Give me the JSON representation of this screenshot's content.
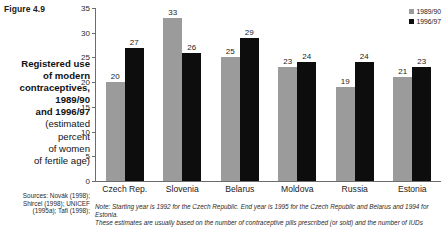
{
  "figure": {
    "number": "Figure 4.9",
    "caption_lines": [
      "Registered use",
      "of modern",
      "contraceptives,",
      "1989/90",
      "and 1996/97"
    ],
    "caption_light_lines": [
      "(estimated",
      "percent",
      "of women",
      "of fertile age)"
    ],
    "sources_lines": [
      "Sources: Novák (1998);",
      "Shircel (1998); UNICEF",
      "(1995a); Tafi (1998);"
    ],
    "note_lines": [
      "Note: Starting year is 1992 for the Czech Republic. End year is 1995 for the Czech Republic and Belarus and 1994 for Estonia.",
      "These estimates are usually based on the number of contraceptive pills prescribed (or sold) and the number of IUDs supplied"
    ]
  },
  "legend": {
    "position": "top-right",
    "entries": [
      {
        "label": "1989/90",
        "color": "#9b9b9b"
      },
      {
        "label": "1996/97",
        "color": "#0d0d0d"
      }
    ]
  },
  "chart_data": {
    "type": "bar",
    "title": "Registered use of modern contraceptives, 1989/90 and 1996/97 (estimated percent of women of fertile age)",
    "xlabel": "",
    "ylabel": "",
    "ylim": [
      0,
      35
    ],
    "yticks": [
      0,
      5,
      10,
      15,
      20,
      25,
      30,
      35
    ],
    "grid": false,
    "categories": [
      "Czech Rep.",
      "Slovenia",
      "Belarus",
      "Moldova",
      "Russia",
      "Estonia"
    ],
    "series": [
      {
        "name": "1989/90",
        "color": "#9b9b9b",
        "values": [
          20,
          33,
          25,
          23,
          19,
          21
        ]
      },
      {
        "name": "1996/97",
        "color": "#0d0d0d",
        "values": [
          27,
          26,
          29,
          24,
          24,
          23
        ]
      }
    ]
  }
}
